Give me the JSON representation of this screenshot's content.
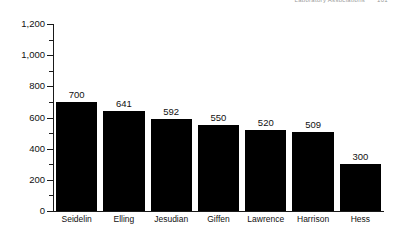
{
  "running_head": {
    "title": "Laboratory Associations",
    "page_number": "101"
  },
  "chart_data": {
    "type": "bar",
    "title": "",
    "subtitle": "",
    "xlabel": "",
    "ylabel": "",
    "categories": [
      "Seidelin",
      "Elling",
      "Jesudian",
      "Giffen",
      "Lawrence",
      "Harrison",
      "Hess"
    ],
    "values": [
      700,
      641,
      592,
      550,
      520,
      509,
      300
    ],
    "value_labels": [
      "700",
      "641",
      "592",
      "550",
      "520",
      "509",
      "300"
    ],
    "ylim": [
      0,
      1200
    ],
    "ytick_values": [
      0,
      200,
      400,
      600,
      800,
      1000,
      1200
    ],
    "ytick_labels": [
      "0",
      "200",
      "400",
      "600",
      "800",
      "1,000",
      "1,200"
    ],
    "yminor_tick_values": [
      100,
      300,
      500,
      700,
      900,
      1100
    ],
    "grid": false,
    "legend": false,
    "legend_position": "none",
    "bar_color": "#000000",
    "axis_color": "#1a1a1a",
    "background_color": "#ffffff"
  }
}
